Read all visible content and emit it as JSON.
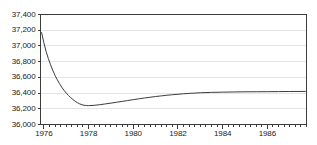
{
  "chart_data": {
    "type": "line",
    "title": "",
    "subtitle": "",
    "xlabel": "",
    "ylabel": "",
    "xlim": [
      1975.85,
      1987.75
    ],
    "ylim": [
      36000,
      37400
    ],
    "grid": true,
    "legend": null,
    "y_ticks": [
      36000,
      36200,
      36400,
      36600,
      36800,
      37000,
      37200,
      37400
    ],
    "y_tick_labels": [
      "36,000",
      "36,200",
      "36,400",
      "36,600",
      "36,800",
      "37,000",
      "37,200",
      "37,400"
    ],
    "x_ticks": [
      1976,
      1978,
      1980,
      1982,
      1984,
      1986
    ],
    "x_tick_labels": [
      "1976",
      "1978",
      "1980",
      "1982",
      "1984",
      "1986"
    ],
    "x_minor_step": 0.25,
    "series": [
      {
        "name": "series-1",
        "color": "#3c3c3c",
        "x": [
          1975.9,
          1976.0,
          1976.1,
          1976.2,
          1976.3,
          1976.4,
          1976.5,
          1976.6,
          1976.7,
          1976.8,
          1976.9,
          1977.0,
          1977.1,
          1977.2,
          1977.3,
          1977.4,
          1977.5,
          1977.6,
          1977.7,
          1977.8,
          1977.9,
          1978.0,
          1978.25,
          1978.5,
          1978.75,
          1979.0,
          1979.25,
          1979.5,
          1979.75,
          1980.0,
          1980.25,
          1980.5,
          1980.75,
          1981.0,
          1981.25,
          1981.5,
          1981.75,
          1982.0,
          1982.25,
          1982.5,
          1982.75,
          1983.0,
          1983.5,
          1984.0,
          1984.5,
          1985.0,
          1985.5,
          1986.0,
          1986.5,
          1987.0,
          1987.7
        ],
        "y": [
          37170,
          37040,
          36930,
          36840,
          36760,
          36690,
          36625,
          36570,
          36520,
          36475,
          36435,
          36400,
          36370,
          36342,
          36318,
          36296,
          36278,
          36263,
          36252,
          36245,
          36241,
          36240,
          36244,
          36252,
          36262,
          36272,
          36283,
          36294,
          36305,
          36316,
          36327,
          36337,
          36347,
          36356,
          36364,
          36372,
          36379,
          36385,
          36391,
          36396,
          36400,
          36404,
          36409,
          36412,
          36414,
          36416,
          36417,
          36418,
          36419,
          36420,
          36421
        ]
      }
    ],
    "colors": {
      "line": "#3c3c3c",
      "grid": "#e4e4e4",
      "axis": "#3c3c3c",
      "background": "#ffffff",
      "text": "#1a1a1a"
    }
  }
}
